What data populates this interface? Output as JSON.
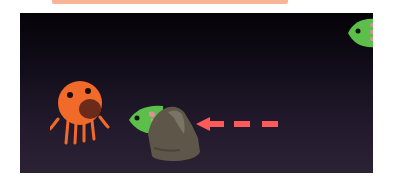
{
  "top_bar": {
    "color": "#f7b596"
  },
  "scene": {
    "background_top": "#050308",
    "background_bottom": "#2b2234",
    "sprites": [
      {
        "name": "octopus",
        "color": "#f26a2a",
        "mouth_color": "#6b2a1a"
      },
      {
        "name": "fish-top",
        "color": "#5bbf4a",
        "spot_color": "#e58aa0"
      },
      {
        "name": "fish-mid",
        "color": "#5bbf4a",
        "spot_color": "#e58aa0"
      },
      {
        "name": "rock",
        "color": "#5e5649"
      },
      {
        "name": "arrow",
        "color": "#ff5a5a",
        "direction": "left"
      }
    ]
  }
}
